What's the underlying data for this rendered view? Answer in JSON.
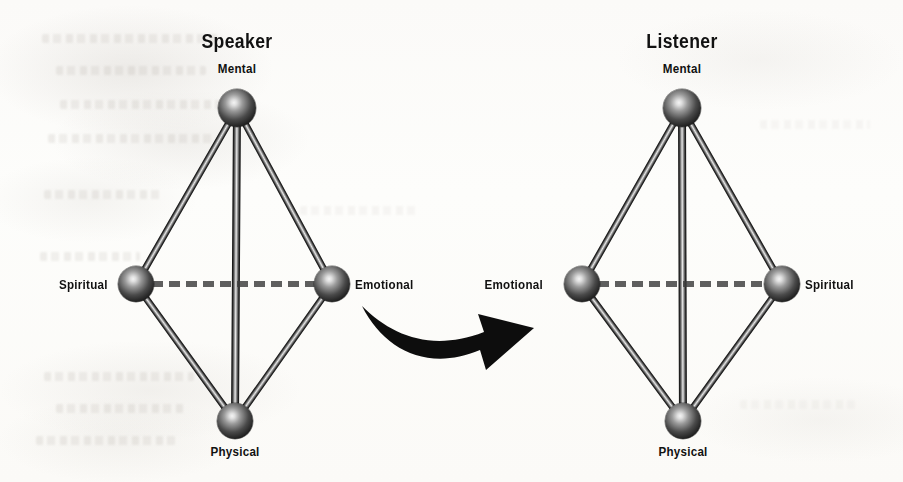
{
  "figure": {
    "type": "diagram",
    "background_color": "#fdfcfa",
    "ink_color": "#111111"
  },
  "panels": [
    {
      "id": "speaker",
      "title": "Speaker",
      "title_x": 237,
      "title_y": 30,
      "nodes": [
        {
          "id": "mental",
          "label": "Mental",
          "cx": 237,
          "cy": 108,
          "r": 19,
          "label_pos": "above"
        },
        {
          "id": "spiritual",
          "label": "Spiritual",
          "cx": 136,
          "cy": 284,
          "r": 18,
          "label_pos": "left"
        },
        {
          "id": "emotional",
          "label": "Emotional",
          "cx": 332,
          "cy": 284,
          "r": 18,
          "label_pos": "right"
        },
        {
          "id": "physical",
          "label": "Physical",
          "cx": 235,
          "cy": 421,
          "r": 18,
          "label_pos": "below"
        }
      ],
      "edges": [
        {
          "from": "mental",
          "to": "spiritual",
          "style": "solid"
        },
        {
          "from": "mental",
          "to": "emotional",
          "style": "solid"
        },
        {
          "from": "mental",
          "to": "physical",
          "style": "solid"
        },
        {
          "from": "spiritual",
          "to": "physical",
          "style": "solid"
        },
        {
          "from": "emotional",
          "to": "physical",
          "style": "solid"
        },
        {
          "from": "spiritual",
          "to": "emotional",
          "style": "dashed"
        }
      ]
    },
    {
      "id": "listener",
      "title": "Listener",
      "title_x": 682,
      "title_y": 30,
      "nodes": [
        {
          "id": "mental",
          "label": "Mental",
          "cx": 682,
          "cy": 108,
          "r": 19,
          "label_pos": "above"
        },
        {
          "id": "emotional",
          "label": "Emotional",
          "cx": 582,
          "cy": 284,
          "r": 18,
          "label_pos": "left"
        },
        {
          "id": "spiritual",
          "label": "Spiritual",
          "cx": 782,
          "cy": 284,
          "r": 18,
          "label_pos": "right"
        },
        {
          "id": "physical",
          "label": "Physical",
          "cx": 683,
          "cy": 421,
          "r": 18,
          "label_pos": "below"
        }
      ],
      "edges": [
        {
          "from": "mental",
          "to": "emotional",
          "style": "solid"
        },
        {
          "from": "mental",
          "to": "spiritual",
          "style": "solid"
        },
        {
          "from": "mental",
          "to": "physical",
          "style": "solid"
        },
        {
          "from": "emotional",
          "to": "physical",
          "style": "solid"
        },
        {
          "from": "spiritual",
          "to": "physical",
          "style": "solid"
        },
        {
          "from": "emotional",
          "to": "spiritual",
          "style": "dashed"
        }
      ]
    }
  ],
  "connector": {
    "name": "curved-arrow",
    "direction": "left-to-right",
    "color": "#0d0d0d"
  },
  "labels": {
    "speaker_title": "Speaker",
    "listener_title": "Listener",
    "speaker_mental": "Mental",
    "speaker_spiritual": "Spiritual",
    "speaker_emotional": "Emotional",
    "speaker_physical": "Physical",
    "listener_mental": "Mental",
    "listener_emotional": "Emotional",
    "listener_spiritual": "Spiritual",
    "listener_physical": "Physical"
  }
}
